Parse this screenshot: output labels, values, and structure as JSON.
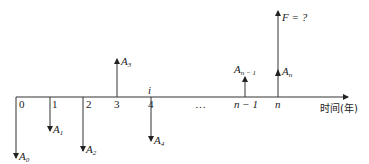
{
  "diagram": {
    "type": "cash-flow-diagram",
    "axis": {
      "label": "时间(年)",
      "ticks": [
        {
          "label": "0",
          "x": 16
        },
        {
          "label": "1",
          "x": 50
        },
        {
          "label": "2",
          "x": 83
        },
        {
          "label": "3",
          "x": 117
        },
        {
          "label": "4",
          "x": 151
        },
        {
          "label": "…",
          "x": 200
        },
        {
          "label": "n − 1",
          "x": 245
        },
        {
          "label": "n",
          "x": 278
        }
      ],
      "interest_label": "i"
    },
    "flows": [
      {
        "name": "A",
        "sub": "0",
        "direction": "down",
        "x": 16
      },
      {
        "name": "A",
        "sub": "1",
        "direction": "down",
        "x": 50
      },
      {
        "name": "A",
        "sub": "2",
        "direction": "down",
        "x": 83
      },
      {
        "name": "A",
        "sub": "3",
        "direction": "up",
        "x": 117
      },
      {
        "name": "A",
        "sub": "4",
        "direction": "down",
        "x": 151
      },
      {
        "name": "A",
        "sub": "n − 1",
        "direction": "up",
        "x": 245
      },
      {
        "name": "A",
        "sub": "n",
        "direction": "up",
        "x": 278
      },
      {
        "name": "F = ?",
        "sub": "",
        "direction": "up",
        "x": 278
      }
    ],
    "labels": {
      "t0": "0",
      "t1": "1",
      "t2": "2",
      "t3": "3",
      "t4": "4",
      "dots": "…",
      "tn1": "n − 1",
      "tn": "n",
      "i": "i",
      "A": "A",
      "s0": "0",
      "s1": "1",
      "s2": "2",
      "s3": "3",
      "s4": "4",
      "sn1": "n − 1",
      "sn": "n",
      "F": "F = ?",
      "axis": "时间(年)"
    }
  }
}
